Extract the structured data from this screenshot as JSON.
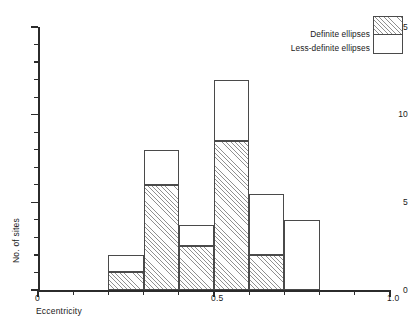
{
  "chart_data": {
    "type": "bar",
    "title": "",
    "xlabel": "Eccentricity",
    "ylabel": "No. of sites",
    "xlim": [
      0,
      1.0
    ],
    "ylim": [
      0,
      15
    ],
    "grid": false,
    "stacked": true,
    "bin_width": 0.1,
    "x_tick_labels": [
      "0",
      "0.5",
      "1.0"
    ],
    "x_tick_values": [
      0,
      0.5,
      1.0
    ],
    "y_tick_labels": [
      "0",
      "5",
      "10",
      "15"
    ],
    "y_tick_values": [
      0,
      5,
      10,
      15
    ],
    "y_minor_step": 1,
    "x_minor_step": 0.1,
    "legend_position": "top-right",
    "categories": [
      "0.2-0.3",
      "0.3-0.4",
      "0.4-0.5",
      "0.5-0.6",
      "0.6-0.7",
      "0.7-0.8"
    ],
    "bin_starts": [
      0.2,
      0.3,
      0.4,
      0.5,
      0.6,
      0.7
    ],
    "bin_ends": [
      0.3,
      0.4,
      0.5,
      0.6,
      0.7,
      0.8
    ],
    "series": [
      {
        "name": "Definite ellipses",
        "fill": "hatched",
        "values": [
          1,
          6,
          2.5,
          8.5,
          2,
          0
        ]
      },
      {
        "name": "Less-definite ellipses",
        "fill": "white",
        "values": [
          1,
          2,
          1.2,
          3.5,
          3.5,
          4
        ]
      }
    ],
    "totals": [
      2,
      8,
      3.7,
      12,
      5.5,
      4
    ]
  },
  "legend": {
    "items": [
      {
        "label": "Definite ellipses",
        "swatch": "hatched"
      },
      {
        "label": "Less-definite ellipses",
        "swatch": "white"
      }
    ]
  },
  "axes": {
    "y_title": "No. of sites",
    "x_title": "Eccentricity"
  }
}
